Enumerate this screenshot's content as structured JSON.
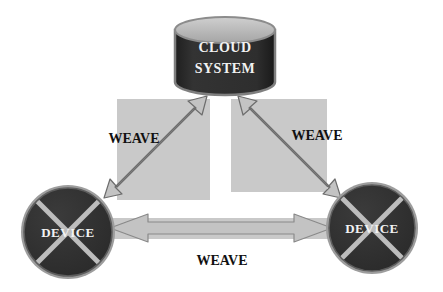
{
  "diagram": {
    "title_present": false,
    "background_color": "#ffffff",
    "nodes": [
      {
        "id": "cloud-system",
        "shape": "cylinder",
        "label_line1": "CLOUD",
        "label_line2": "SYSTEM",
        "fill_color": "#2b2b2b",
        "top_fill_color": "#b3b3b3",
        "text_color": "#f2f2f2",
        "x": 175,
        "y": 17,
        "width": 100,
        "height": 78
      },
      {
        "id": "device-left",
        "shape": "circle-with-cross",
        "label": "DEVICE",
        "fill_color": "#313131",
        "ring_color": "#a8a8a8",
        "cross_color": "#b9b9b9",
        "text_color": "#f2f2f2",
        "cx": 68,
        "cy": 232,
        "r": 48
      },
      {
        "id": "device-right",
        "shape": "circle-with-cross",
        "label": "DEVICE",
        "fill_color": "#313131",
        "ring_color": "#a8a8a8",
        "cross_color": "#b9b9b9",
        "text_color": "#f2f2f2",
        "cx": 372,
        "cy": 228,
        "r": 47
      }
    ],
    "panels": [
      {
        "id": "panel-left",
        "fill_color": "#c9c9c9",
        "x": 117,
        "y": 99,
        "width": 93,
        "height": 101
      },
      {
        "id": "panel-right",
        "fill_color": "#c9c9c9",
        "x": 231,
        "y": 99,
        "width": 96,
        "height": 93
      },
      {
        "id": "panel-bottom",
        "fill_color": "#c9c9c9",
        "x": 110,
        "y": 218,
        "width": 222,
        "height": 21
      }
    ],
    "connectors": [
      {
        "id": "weave-left",
        "label": "WEAVE",
        "from": "device-left",
        "to": "cloud-system",
        "style": "double-headed-arrow",
        "fill_color": "#c3c3c3",
        "stroke_color": "#6d6d6d",
        "label_x": 134,
        "label_y": 143
      },
      {
        "id": "weave-right",
        "label": "WEAVE",
        "from": "cloud-system",
        "to": "device-right",
        "style": "double-headed-arrow",
        "fill_color": "#c3c3c3",
        "stroke_color": "#6d6d6d",
        "label_x": 317,
        "label_y": 140
      },
      {
        "id": "weave-bottom",
        "label": "WEAVE",
        "from": "device-left",
        "to": "device-right",
        "style": "double-headed-arrow",
        "fill_color": "#c3c3c3",
        "stroke_color": "#8a8a8a",
        "label_x": 222,
        "label_y": 265
      }
    ]
  }
}
